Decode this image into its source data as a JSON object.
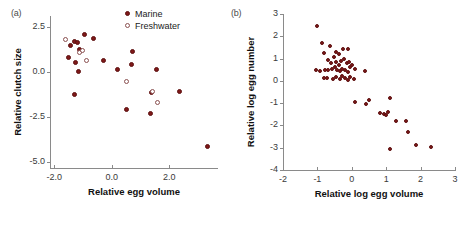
{
  "figure": {
    "panel_a_label": "(a)",
    "panel_b_label": "(b)",
    "marker_color": "#7e1818",
    "open_marker_edge_color": "#8a5050",
    "axis_color": "#8a8a8a"
  },
  "legend": {
    "marine_label": "Marine",
    "freshwater_label": "Freshwater",
    "marine_icon": "filled-circle-icon",
    "freshwater_icon": "open-circle-icon",
    "position": "top-right-inside"
  },
  "chart_data": [
    {
      "type": "scatter",
      "panel": "(a)",
      "title": "",
      "xlabel": "Relative egg volume",
      "ylabel": "Relative clutch size",
      "xlim": [
        -2.15,
        3.7
      ],
      "ylim": [
        -5.35,
        3.1
      ],
      "xticks": [
        -2.0,
        0.0,
        2.0
      ],
      "xticklabels": [
        "-2.0",
        "0.0",
        "2.0"
      ],
      "yticks": [
        2.5,
        0.0,
        -2.5,
        -5.0
      ],
      "yticklabels": [
        "2.5",
        "0.0",
        "-2.5",
        "-5.0"
      ],
      "grid": false,
      "series": [
        {
          "name": "Marine",
          "marker": "filled-circle",
          "color": "#7e1818",
          "points": [
            [
              -1.45,
              1.45
            ],
            [
              -1.52,
              0.82
            ],
            [
              -1.3,
              1.68
            ],
            [
              -1.2,
              1.65
            ],
            [
              -1.13,
              1.22
            ],
            [
              -1.25,
              0.52
            ],
            [
              -1.15,
              0.0
            ],
            [
              -1.3,
              -1.25
            ],
            [
              -0.95,
              2.05
            ],
            [
              -0.63,
              1.85
            ],
            [
              -0.3,
              0.62
            ],
            [
              0.2,
              0.1
            ],
            [
              0.72,
              1.15
            ],
            [
              0.7,
              0.42
            ],
            [
              0.5,
              -2.1
            ],
            [
              1.38,
              -1.15
            ],
            [
              1.35,
              -2.3
            ],
            [
              1.55,
              0.1
            ],
            [
              2.35,
              -1.1
            ],
            [
              3.35,
              -4.15
            ]
          ]
        },
        {
          "name": "Freshwater",
          "marker": "open-circle",
          "color": "#8a5050",
          "points": [
            [
              -1.6,
              1.78
            ],
            [
              -1.12,
              1.05
            ],
            [
              -0.88,
              0.65
            ],
            [
              -1.02,
              1.18
            ],
            [
              0.5,
              -0.52
            ],
            [
              1.42,
              -1.08
            ],
            [
              1.58,
              -1.72
            ]
          ]
        }
      ]
    },
    {
      "type": "scatter",
      "panel": "(b)",
      "title": "",
      "xlabel": "Relative log egg volume",
      "ylabel": "Relative log egg number",
      "xlim": [
        -2.0,
        3.0
      ],
      "ylim": [
        -4.0,
        3.0
      ],
      "xticks": [
        -2,
        -1,
        0,
        1,
        2,
        3
      ],
      "xticklabels": [
        "-2",
        "-1",
        "0",
        "1",
        "2",
        "3"
      ],
      "yticks": [
        3,
        2,
        1,
        0,
        -1,
        -2,
        -3,
        -4
      ],
      "yticklabels": [
        "3",
        "2",
        "1",
        "0",
        "-1",
        "-2",
        "-3",
        "-4"
      ],
      "grid": false,
      "series": [
        {
          "name": "All species",
          "marker": "filled-circle",
          "color": "#7e1818",
          "points": [
            [
              -1.0,
              2.48
            ],
            [
              -0.88,
              1.7
            ],
            [
              -0.62,
              1.55
            ],
            [
              -0.8,
              1.25
            ],
            [
              -0.45,
              1.3
            ],
            [
              -0.38,
              1.2
            ],
            [
              -0.25,
              1.42
            ],
            [
              -0.12,
              1.45
            ],
            [
              -0.7,
              0.92
            ],
            [
              -0.6,
              0.78
            ],
            [
              -0.52,
              1.05
            ],
            [
              -0.45,
              0.85
            ],
            [
              -0.38,
              0.72
            ],
            [
              -0.3,
              0.88
            ],
            [
              -0.22,
              1.0
            ],
            [
              -0.15,
              0.78
            ],
            [
              -0.08,
              0.85
            ],
            [
              -1.05,
              0.5
            ],
            [
              -0.92,
              0.45
            ],
            [
              -0.78,
              0.5
            ],
            [
              -0.7,
              0.48
            ],
            [
              -0.58,
              0.55
            ],
            [
              -0.5,
              0.6
            ],
            [
              -0.42,
              0.5
            ],
            [
              -0.35,
              0.42
            ],
            [
              -0.28,
              0.55
            ],
            [
              -0.2,
              0.48
            ],
            [
              -0.12,
              0.38
            ],
            [
              -0.05,
              0.6
            ],
            [
              0.02,
              0.72
            ],
            [
              0.1,
              0.52
            ],
            [
              -0.82,
              0.12
            ],
            [
              -0.72,
              0.15
            ],
            [
              -0.55,
              0.1
            ],
            [
              -0.45,
              0.18
            ],
            [
              -0.35,
              0.08
            ],
            [
              -0.28,
              0.22
            ],
            [
              -0.2,
              0.12
            ],
            [
              -0.12,
              0.05
            ],
            [
              -0.05,
              0.18
            ],
            [
              0.05,
              0.1
            ],
            [
              0.38,
              0.42
            ],
            [
              0.1,
              -0.95
            ],
            [
              0.42,
              -1.05
            ],
            [
              0.5,
              -0.88
            ],
            [
              0.82,
              -1.42
            ],
            [
              0.95,
              -1.5
            ],
            [
              1.0,
              -1.52
            ],
            [
              1.05,
              -1.38
            ],
            [
              1.1,
              -0.75
            ],
            [
              1.28,
              -1.82
            ],
            [
              1.58,
              -1.78
            ],
            [
              1.62,
              -2.28
            ],
            [
              1.1,
              -3.08
            ],
            [
              1.88,
              -2.88
            ],
            [
              2.3,
              -2.95
            ]
          ]
        }
      ]
    }
  ]
}
